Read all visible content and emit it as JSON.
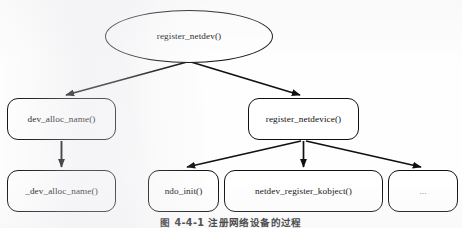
{
  "figure": {
    "caption": "图 4-4-1  注册网络设备的过程",
    "background_color": "#fefefe",
    "line_color": "#101010"
  },
  "nodes": {
    "root": {
      "label": "register_netdev()",
      "shape": "ellipse"
    },
    "dev_alloc_name": {
      "label": "dev_alloc_name()",
      "shape": "rounded-rect"
    },
    "underscore_dev_alloc_name": {
      "label": "_dev_alloc_name()",
      "shape": "rounded-rect"
    },
    "register_netdevice": {
      "label": "register_netdevice()",
      "shape": "rounded-rect"
    },
    "ndo_init": {
      "label": "ndo_init()",
      "shape": "rounded-rect"
    },
    "netdev_register_kobject": {
      "label": "netdev_register_kobject()",
      "shape": "rounded-rect"
    },
    "more": {
      "label": "...",
      "shape": "rounded-rect"
    }
  },
  "edges": [
    {
      "from": "root",
      "to": "dev_alloc_name"
    },
    {
      "from": "root",
      "to": "register_netdevice"
    },
    {
      "from": "dev_alloc_name",
      "to": "underscore_dev_alloc_name"
    },
    {
      "from": "register_netdevice",
      "to": "ndo_init"
    },
    {
      "from": "register_netdevice",
      "to": "netdev_register_kobject"
    },
    {
      "from": "register_netdevice",
      "to": "more"
    }
  ]
}
